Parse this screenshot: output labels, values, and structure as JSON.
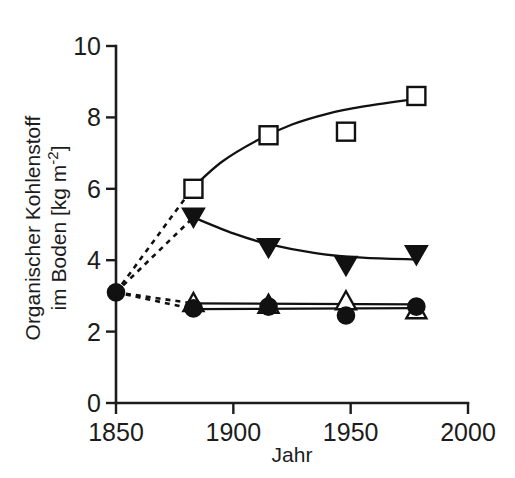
{
  "chart_data": {
    "type": "line",
    "title": "",
    "xlabel": "Jahr",
    "ylabel": "Organischer Kohlenstoff im Boden [kg m-2]",
    "ylabel_line1": "Organischer Kohlenstoff",
    "ylabel_line2_pre": "im Boden [kg m",
    "ylabel_line2_sup": "-2",
    "ylabel_line2_post": "]",
    "xlim": [
      1850,
      2000
    ],
    "ylim": [
      0,
      10
    ],
    "xticks": [
      1850,
      1900,
      1950,
      2000
    ],
    "xtick_labels": [
      "1850",
      "1900",
      "1950",
      "2000"
    ],
    "yticks": [
      0,
      2,
      4,
      6,
      8,
      10
    ],
    "ytick_labels": [
      "0",
      "2",
      "4",
      "6",
      "8",
      "10"
    ],
    "grid": false,
    "legend": "none",
    "x": [
      1850,
      1883,
      1915,
      1948,
      1978
    ],
    "series": [
      {
        "name": "open-square",
        "marker": "open-square",
        "values": [
          3.1,
          6.0,
          7.5,
          7.6,
          8.6
        ],
        "fit_curve": [
          [
            1883,
            6.05
          ],
          [
            1895,
            6.75
          ],
          [
            1910,
            7.35
          ],
          [
            1925,
            7.8
          ],
          [
            1940,
            8.1
          ],
          [
            1955,
            8.3
          ],
          [
            1978,
            8.52
          ]
        ],
        "lead_dashed": true
      },
      {
        "name": "filled-down-triangle",
        "marker": "filled-down-triangle",
        "values": [
          3.1,
          5.2,
          4.35,
          3.85,
          4.15
        ],
        "fit_curve": [
          [
            1883,
            5.2
          ],
          [
            1900,
            4.75
          ],
          [
            1915,
            4.45
          ],
          [
            1935,
            4.2
          ],
          [
            1955,
            4.07
          ],
          [
            1978,
            4.02
          ]
        ],
        "lead_dashed": true
      },
      {
        "name": "open-up-triangle",
        "marker": "open-up-triangle",
        "values": [
          3.1,
          2.8,
          2.75,
          2.85,
          2.6
        ],
        "fit_curve": [
          [
            1883,
            2.79
          ],
          [
            1978,
            2.76
          ]
        ],
        "lead_dashed": true
      },
      {
        "name": "filled-circle",
        "marker": "filled-circle",
        "values": [
          3.1,
          2.65,
          2.7,
          2.45,
          2.7
        ],
        "fit_curve": [
          [
            1883,
            2.63
          ],
          [
            1978,
            2.66
          ]
        ],
        "lead_dashed": true
      }
    ],
    "origin_point": {
      "x": 1850,
      "y": 3.1,
      "marker": "filled-circle"
    },
    "colors": {
      "line": "#111111",
      "axis": "#1c1c1c",
      "background": "#ffffff"
    }
  },
  "figure": {
    "xlabel": "Jahr"
  }
}
